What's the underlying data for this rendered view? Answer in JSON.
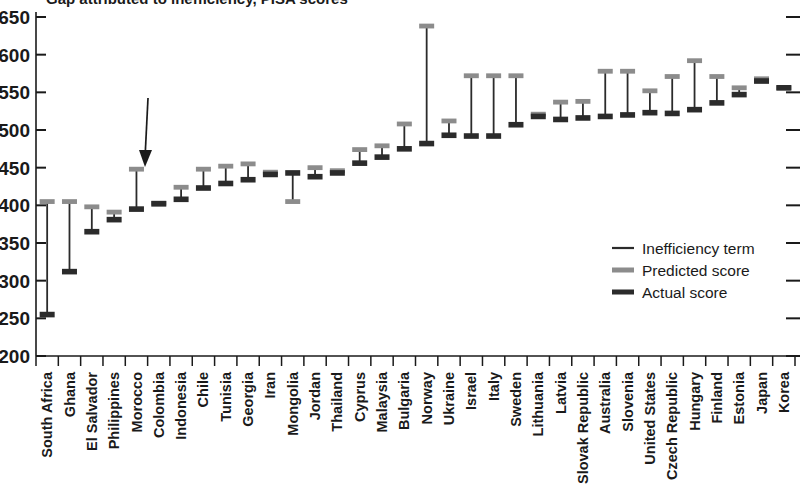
{
  "chart_data": {
    "type": "bar",
    "title": "Gap attributed to inefficiency, PISA scores",
    "xlabel": "",
    "ylabel": "",
    "ylim": [
      200,
      650
    ],
    "yticks": [
      200,
      250,
      300,
      350,
      400,
      450,
      500,
      550,
      600,
      650
    ],
    "grid": false,
    "legend_position": "right-middle",
    "categories": [
      "South Africa",
      "Ghana",
      "El Salvador",
      "Philippines",
      "Morocco",
      "Colombia",
      "Indonesia",
      "Chile",
      "Tunisia",
      "Georgia",
      "Iran",
      "Mongolia",
      "Jordan",
      "Thailand",
      "Cyprus",
      "Malaysia",
      "Bulgaria",
      "Norway",
      "Ukraine",
      "Israel",
      "Italy",
      "Sweden",
      "Lithuania",
      "Latvia",
      "Slovak Republic",
      "Australia",
      "Slovenia",
      "United States",
      "Czech Republic",
      "Hungary",
      "Finland",
      "Estonia",
      "Japan",
      "Korea"
    ],
    "series": [
      {
        "name": "Predicted score",
        "color": "#8c8c8c",
        "values": [
          405,
          405,
          398,
          391,
          448,
          403,
          424,
          448,
          452,
          455,
          444,
          405,
          450,
          446,
          474,
          479,
          508,
          638,
          512,
          572,
          572,
          572,
          521,
          537,
          538,
          578,
          578,
          552,
          571,
          592,
          571,
          556,
          568,
          556
        ]
      },
      {
        "name": "Actual score",
        "color": "#2b2b2b",
        "values": [
          255,
          312,
          365,
          381,
          395,
          402,
          408,
          423,
          429,
          434,
          441,
          443,
          438,
          443,
          456,
          464,
          475,
          482,
          493,
          492,
          492,
          507,
          518,
          514,
          516,
          518,
          520,
          523,
          522,
          527,
          536,
          547,
          565,
          556
        ]
      }
    ],
    "inefficiency_term_label": "Inefficiency term"
  },
  "legend": {
    "items": [
      {
        "label": "Inefficiency term",
        "color": "#2b2b2b",
        "style": "thin"
      },
      {
        "label": "Predicted score",
        "color": "#8c8c8c",
        "style": "thick"
      },
      {
        "label": "Actual score",
        "color": "#2b2b2b",
        "style": "thick"
      }
    ]
  },
  "annotation": {
    "line1": "Gap attributed to",
    "line2": "inefficiency (Morocco)",
    "target_category": "Morocco"
  },
  "axis": {
    "y_min_label": "200",
    "y_max_label": "650"
  }
}
